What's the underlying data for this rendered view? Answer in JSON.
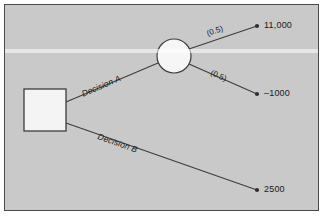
{
  "diagram": {
    "type": "decision-tree",
    "background_color": "#c9c9c9",
    "frame_color": "#4a4a4a",
    "line_color": "#3c3c3c",
    "text_color": "#1a1a1a",
    "node_fill": "#f2f2f2",
    "nodes": [
      {
        "id": "decision-node",
        "shape": "square",
        "role": "decision",
        "label": "",
        "x": 19,
        "y": 84,
        "w": 42,
        "h": 42
      },
      {
        "id": "chance-node",
        "shape": "circle",
        "role": "chance",
        "label": "",
        "cx": 169,
        "cy": 51,
        "r": 17
      }
    ],
    "branches": [
      {
        "id": "branch-decision-a",
        "label": "Decision A",
        "from": "decision-node",
        "to": "chance-node",
        "x1": 61,
        "y1": 97,
        "x2": 153,
        "y2": 58
      },
      {
        "id": "branch-decision-b",
        "label": "Decision B",
        "from": "decision-node",
        "to": "outcome-2500",
        "x1": 61,
        "y1": 118,
        "x2": 252,
        "y2": 185
      },
      {
        "id": "branch-chance-high",
        "label": "(0.5)",
        "from": "chance-node",
        "to": "outcome-11000",
        "x1": 184,
        "y1": 43,
        "x2": 252,
        "y2": 21
      },
      {
        "id": "branch-chance-low",
        "label": "(0.5)",
        "from": "chance-node",
        "to": "outcome-minus1000",
        "x1": 184,
        "y1": 60,
        "x2": 252,
        "y2": 89
      }
    ],
    "outcomes": [
      {
        "id": "outcome-11000",
        "value": "11,000",
        "x": 252,
        "y": 21
      },
      {
        "id": "outcome-minus1000",
        "value": "–1000",
        "x": 252,
        "y": 89
      },
      {
        "id": "outcome-2500",
        "value": "2500",
        "x": 252,
        "y": 185
      }
    ]
  }
}
